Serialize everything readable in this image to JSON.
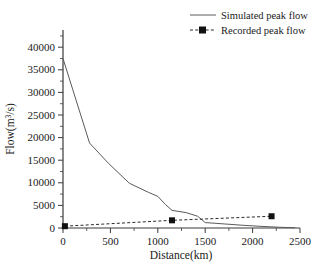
{
  "chart_data": {
    "type": "line",
    "title": "",
    "xlabel": "Distance(km)",
    "ylabel_main": "Flow(m",
    "ylabel_sup": "3",
    "ylabel_tail": "/s)",
    "ylabel_full": "Flow(m3/s)",
    "xlim": [
      0,
      2500
    ],
    "ylim": [
      0,
      42000
    ],
    "grid": false,
    "legend_position": "top-right",
    "xticks": [
      0,
      500,
      1000,
      1500,
      2000,
      2500
    ],
    "xtick_labels": [
      "0",
      "500",
      "1000",
      "1500",
      "2000",
      "2500"
    ],
    "yticks": [
      0,
      5000,
      10000,
      15000,
      20000,
      25000,
      30000,
      35000,
      40000
    ],
    "ytick_labels": [
      "0",
      "5000",
      "10000",
      "15000",
      "20000",
      "25000",
      "30000",
      "35000",
      "40000"
    ],
    "series": [
      {
        "name": "Simulated peak flow",
        "style": "solid",
        "marker": "none",
        "color": "#5a5a5a",
        "x": [
          0,
          280,
          480,
          700,
          900,
          1000,
          1080,
          1150,
          1300,
          1420,
          1500,
          1700,
          1900,
          2100,
          2300,
          2450
        ],
        "values": [
          37500,
          18800,
          14300,
          9900,
          7900,
          7000,
          5200,
          3900,
          3400,
          2600,
          1200,
          900,
          600,
          350,
          150,
          60
        ]
      },
      {
        "name": "Recorded peak flow",
        "style": "dashed",
        "marker": "square",
        "color": "#2a2a2a",
        "x": [
          20,
          1150,
          2200
        ],
        "values": [
          400,
          1700,
          2600
        ],
        "marker_points": [
          {
            "x": 20,
            "y": 400
          },
          {
            "x": 1150,
            "y": 1700
          },
          {
            "x": 2200,
            "y": 2600
          }
        ]
      }
    ]
  },
  "legend": {
    "items": [
      {
        "label": "Simulated peak flow",
        "style": "solid",
        "marker": "none"
      },
      {
        "label": "Recorded peak flow",
        "style": "dashed",
        "marker": "square"
      }
    ]
  }
}
